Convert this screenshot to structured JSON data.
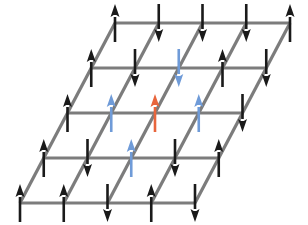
{
  "figure": {
    "width": 308,
    "height": 225,
    "background_color": "#ffffff"
  },
  "lattice": {
    "rows": 5,
    "cols": 5,
    "origin_x": 115,
    "origin_y": 23,
    "col_step_x": 43.75,
    "row_step_y": 45,
    "row_shift_x": -23.75,
    "line_color": "#7c7c7c",
    "line_width": 3.2
  },
  "spins": {
    "colors": {
      "black": "#1a1a1a",
      "blue": "#6f9bd8",
      "red": "#e8653c"
    },
    "geometry": {
      "length": 38,
      "head_width": 9,
      "head_length": 13,
      "shaft_width": 2.6
    },
    "sites": [
      {
        "row": 0,
        "col": 0,
        "direction": "up",
        "color": "black"
      },
      {
        "row": 0,
        "col": 1,
        "direction": "down",
        "color": "black"
      },
      {
        "row": 0,
        "col": 2,
        "direction": "down",
        "color": "black"
      },
      {
        "row": 0,
        "col": 3,
        "direction": "down",
        "color": "black"
      },
      {
        "row": 0,
        "col": 4,
        "direction": "up",
        "color": "black"
      },
      {
        "row": 1,
        "col": 0,
        "direction": "up",
        "color": "black"
      },
      {
        "row": 1,
        "col": 1,
        "direction": "down",
        "color": "black"
      },
      {
        "row": 1,
        "col": 2,
        "direction": "down",
        "color": "blue"
      },
      {
        "row": 1,
        "col": 3,
        "direction": "up",
        "color": "black"
      },
      {
        "row": 1,
        "col": 4,
        "direction": "down",
        "color": "black"
      },
      {
        "row": 2,
        "col": 0,
        "direction": "up",
        "color": "black"
      },
      {
        "row": 2,
        "col": 1,
        "direction": "up",
        "color": "blue"
      },
      {
        "row": 2,
        "col": 2,
        "direction": "up",
        "color": "red"
      },
      {
        "row": 2,
        "col": 3,
        "direction": "up",
        "color": "blue"
      },
      {
        "row": 2,
        "col": 4,
        "direction": "down",
        "color": "black"
      },
      {
        "row": 3,
        "col": 0,
        "direction": "up",
        "color": "black"
      },
      {
        "row": 3,
        "col": 1,
        "direction": "down",
        "color": "black"
      },
      {
        "row": 3,
        "col": 2,
        "direction": "up",
        "color": "blue"
      },
      {
        "row": 3,
        "col": 3,
        "direction": "down",
        "color": "black"
      },
      {
        "row": 3,
        "col": 4,
        "direction": "up",
        "color": "black"
      },
      {
        "row": 4,
        "col": 0,
        "direction": "up",
        "color": "black"
      },
      {
        "row": 4,
        "col": 1,
        "direction": "up",
        "color": "black"
      },
      {
        "row": 4,
        "col": 2,
        "direction": "down",
        "color": "black"
      },
      {
        "row": 4,
        "col": 3,
        "direction": "up",
        "color": "black"
      },
      {
        "row": 4,
        "col": 4,
        "direction": "down",
        "color": "black"
      }
    ]
  }
}
